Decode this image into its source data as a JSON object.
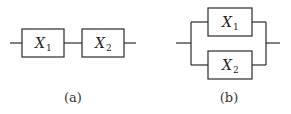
{
  "diagrams": {
    "series": {
      "caption": "(a)",
      "components": [
        {
          "name": "X",
          "subscript": "1"
        },
        {
          "name": "X",
          "subscript": "2"
        }
      ],
      "connection": "series"
    },
    "parallel": {
      "caption": "(b)",
      "components": [
        {
          "name": "X",
          "subscript": "1"
        },
        {
          "name": "X",
          "subscript": "2"
        }
      ],
      "connection": "parallel"
    }
  },
  "colors": {
    "line": "#2a2a2a",
    "background": "#ffffff"
  }
}
